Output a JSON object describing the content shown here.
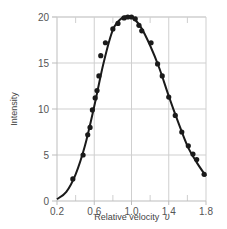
{
  "chart_data": {
    "type": "scatter",
    "title": "",
    "xlabel": "Relative velocity",
    "xlabel_symbol": "υ",
    "ylabel": "Intensity",
    "xlim": [
      0.2,
      1.8
    ],
    "ylim": [
      0,
      20
    ],
    "x_ticks": [
      0.2,
      0.6,
      1.0,
      1.4,
      1.8
    ],
    "x_tick_labels": [
      "0.2",
      "0.6",
      "1.0",
      "1.4",
      "1.8"
    ],
    "x_minor_ticks": [
      0.4,
      0.8,
      1.2,
      1.6
    ],
    "y_ticks": [
      0,
      5,
      10,
      15,
      20
    ],
    "y_tick_labels": [
      "0",
      "5",
      "10",
      "15",
      "20"
    ],
    "grid": true,
    "legend": null,
    "series": [
      {
        "name": "measured",
        "kind": "points",
        "x": [
          0.37,
          0.48,
          0.53,
          0.555,
          0.58,
          0.61,
          0.63,
          0.65,
          0.67,
          0.72,
          0.8,
          0.855,
          0.92,
          0.96,
          1.0,
          1.04,
          1.08,
          1.11,
          1.21,
          1.28,
          1.33,
          1.4,
          1.47,
          1.54,
          1.61,
          1.66,
          1.7,
          1.78
        ],
        "y": [
          2.4,
          5.0,
          7.2,
          8.0,
          9.9,
          11.2,
          12.0,
          13.6,
          15.8,
          17.2,
          18.7,
          19.3,
          19.9,
          20.0,
          20.0,
          19.8,
          19.1,
          18.5,
          17.2,
          14.9,
          13.6,
          11.3,
          9.3,
          7.5,
          6.0,
          5.1,
          4.5,
          2.9
        ]
      },
      {
        "name": "fit",
        "kind": "line",
        "x": [
          0.2,
          0.3,
          0.4,
          0.5,
          0.6,
          0.7,
          0.8,
          0.9,
          1.0,
          1.1,
          1.2,
          1.3,
          1.4,
          1.5,
          1.6,
          1.7,
          1.8
        ],
        "y": [
          0.2,
          1.0,
          2.9,
          6.0,
          10.3,
          15.0,
          18.6,
          19.9,
          20.0,
          18.9,
          16.9,
          14.4,
          11.4,
          8.6,
          6.0,
          4.2,
          2.7
        ]
      }
    ],
    "colors": {
      "points": "#1a1a1a",
      "line": "#1a1a1a",
      "grid": "#cfcfcf"
    }
  }
}
